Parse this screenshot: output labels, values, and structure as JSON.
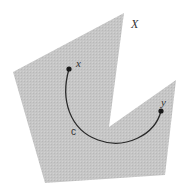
{
  "diagram": {
    "region": {
      "label": "X",
      "fill": "#c4c4c4",
      "points": [
        [
          124,
          13
        ],
        [
          109,
          127
        ],
        [
          176,
          80
        ],
        [
          165,
          175
        ],
        [
          45,
          183
        ],
        [
          13,
          72
        ]
      ]
    },
    "curve": {
      "label": "c",
      "color": "#2a2a2a",
      "path": "M69,69 C60,100 70,130 98,140 C125,150 155,135 161,111"
    },
    "points": [
      {
        "name": "x",
        "label": "x",
        "cx": 69,
        "cy": 69
      },
      {
        "name": "y",
        "label": "y",
        "cx": 161,
        "cy": 111
      }
    ],
    "labels": {
      "region": "X",
      "curve": "c",
      "start": "x",
      "end": "y"
    }
  }
}
